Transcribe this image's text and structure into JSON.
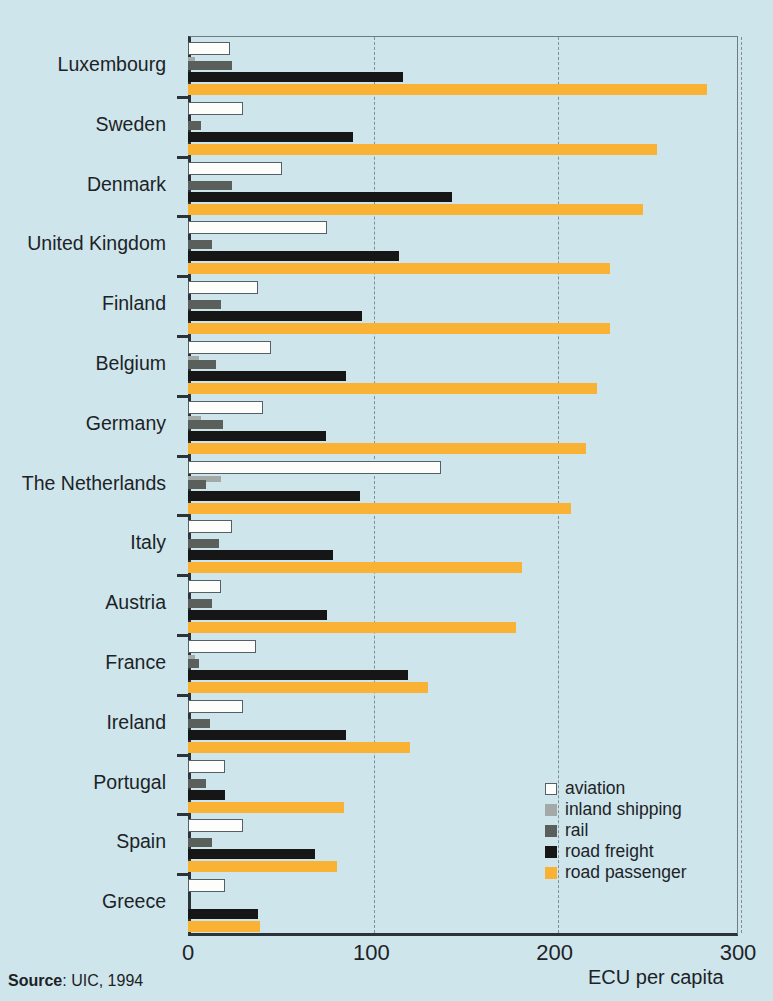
{
  "chart_data": {
    "type": "bar",
    "orientation": "horizontal",
    "title": "",
    "xlabel": "ECU per capita",
    "ylabel": "",
    "xlim": [
      0,
      300
    ],
    "xticks": [
      0,
      100,
      200,
      300
    ],
    "grid": true,
    "legend_position": "inside-bottom-right",
    "source": "Source: UIC, 1994",
    "source_prefix": "Source",
    "source_rest": ": UIC, 1994",
    "categories": [
      "Luxembourg",
      "Sweden",
      "Denmark",
      "United Kingdom",
      "Finland",
      "Belgium",
      "Germany",
      "The Netherlands",
      "Italy",
      "Austria",
      "France",
      "Ireland",
      "Portugal",
      "Spain",
      "Greece"
    ],
    "series": [
      {
        "name": "aviation",
        "color": "#fdfdfb",
        "values": [
          23,
          30,
          51,
          76,
          38,
          45,
          41,
          138,
          24,
          18,
          37,
          30,
          20,
          30,
          20
        ]
      },
      {
        "name": "inland shipping",
        "color": "#a3a9a6",
        "values": [
          4,
          0,
          0,
          0,
          0,
          6,
          7,
          18,
          0,
          0,
          4,
          0,
          0,
          0,
          0
        ]
      },
      {
        "name": "rail",
        "color": "#5a5f5c",
        "values": [
          24,
          7,
          24,
          13,
          18,
          15,
          19,
          10,
          17,
          13,
          6,
          12,
          10,
          13,
          0
        ]
      },
      {
        "name": "road freight",
        "color": "#161616",
        "values": [
          117,
          90,
          144,
          115,
          95,
          86,
          75,
          94,
          79,
          76,
          120,
          86,
          20,
          69,
          38
        ]
      },
      {
        "name": "road passenger",
        "color": "#f9b233",
        "values": [
          283,
          256,
          248,
          230,
          230,
          223,
          217,
          209,
          182,
          179,
          131,
          121,
          85,
          81,
          39
        ]
      }
    ]
  },
  "legend": {
    "items": [
      {
        "label": "aviation",
        "key": "aviation"
      },
      {
        "label": "inland shipping",
        "key": "inland"
      },
      {
        "label": "rail",
        "key": "rail"
      },
      {
        "label": "road freight",
        "key": "freight"
      },
      {
        "label": "road passenger",
        "key": "passenger"
      }
    ]
  },
  "colors": {
    "background": "#cfe5ec",
    "axis": "#2c3338",
    "grid": "#7d8f98",
    "aviation": "#fdfdfb",
    "inland_shipping": "#a3a9a6",
    "rail": "#5a5f5c",
    "road_freight": "#161616",
    "road_passenger": "#f9b233"
  }
}
